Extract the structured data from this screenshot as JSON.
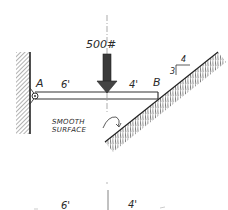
{
  "diagram": {
    "load": {
      "label": "500#",
      "color": "#3a3a3a"
    },
    "support_a": {
      "label": "A"
    },
    "support_b": {
      "label": "B"
    },
    "beam": {
      "segment_left": "6'",
      "segment_right": "4'"
    },
    "incline": {
      "slope_rise": "3",
      "slope_run": "4"
    },
    "note": {
      "line1": "SMOOTH",
      "line2": "SURFACE"
    },
    "dimension_line": {
      "left": "6'",
      "right": "4'"
    },
    "colors": {
      "ink": "#2a2a2a",
      "hatch": "#555555",
      "centerline": "#888888"
    }
  }
}
